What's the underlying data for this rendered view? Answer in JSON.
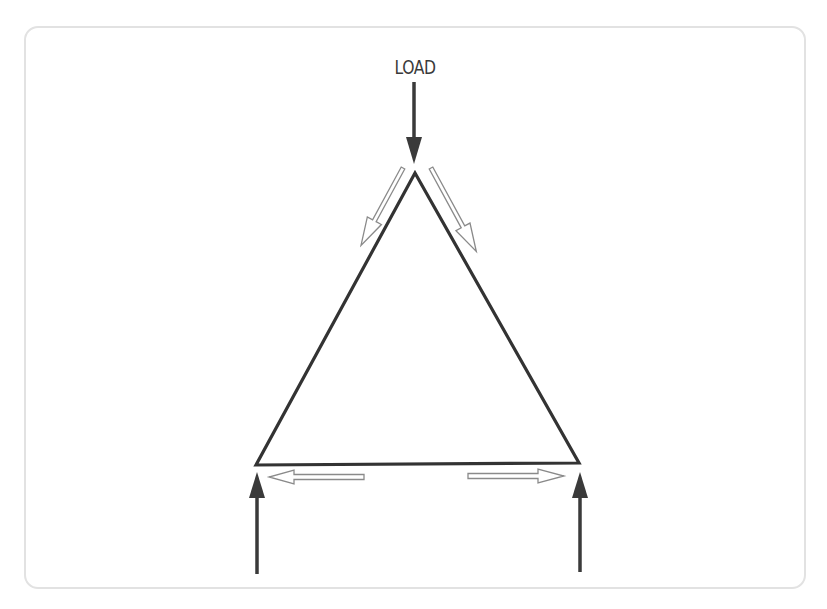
{
  "diagram": {
    "type": "force-diagram",
    "labels": {
      "load": "LOAD"
    },
    "colors": {
      "stroke": "#333333",
      "force_arrow": "#3a3a3a",
      "internal_arrow_outline": "#8a8a8a",
      "frame_border": "#e2e2e2",
      "background": "#ffffff"
    },
    "shapes": {
      "triangle": {
        "apex": [
          415,
          173
        ],
        "base_left": [
          256,
          465
        ],
        "base_right": [
          579,
          463
        ]
      }
    },
    "arrows": [
      {
        "id": "load-arrow",
        "kind": "external-force",
        "direction": "down",
        "style": "solid",
        "at": "apex"
      },
      {
        "id": "left-support-reaction",
        "kind": "reaction-force",
        "direction": "up",
        "style": "solid",
        "at": "base_left"
      },
      {
        "id": "right-support-reaction",
        "kind": "reaction-force",
        "direction": "up",
        "style": "solid",
        "at": "base_right"
      },
      {
        "id": "left-member-compression",
        "kind": "internal-force",
        "direction": "down-left",
        "style": "hollow",
        "along": "left side"
      },
      {
        "id": "right-member-compression",
        "kind": "internal-force",
        "direction": "down-right",
        "style": "hollow",
        "along": "right side"
      },
      {
        "id": "base-tension-left",
        "kind": "internal-force",
        "direction": "left",
        "style": "hollow",
        "along": "base"
      },
      {
        "id": "base-tension-right",
        "kind": "internal-force",
        "direction": "right",
        "style": "hollow",
        "along": "base"
      }
    ]
  }
}
